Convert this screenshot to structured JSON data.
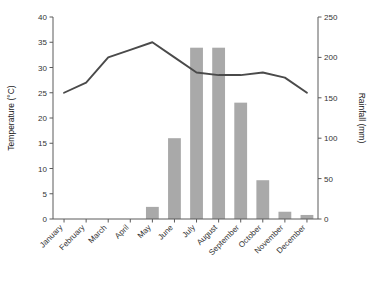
{
  "chart_data": {
    "type": "bar",
    "title": "",
    "subtitle": "",
    "categories": [
      "January",
      "February",
      "March",
      "April",
      "May",
      "June",
      "July",
      "August",
      "September",
      "October",
      "November",
      "December"
    ],
    "series": [
      {
        "name": "Rainfall",
        "type": "bar",
        "axis": "right",
        "unit": "mm",
        "values": [
          0,
          0,
          0,
          0,
          15,
          100,
          212,
          212,
          144,
          48,
          9,
          5
        ]
      },
      {
        "name": "Temperature",
        "type": "line",
        "axis": "left",
        "unit": "°C",
        "values": [
          25,
          27,
          32,
          33.5,
          35,
          32,
          29,
          28.5,
          28.5,
          29,
          28,
          25
        ]
      }
    ],
    "xlabel": "",
    "ylabel": "Temperature (°C)",
    "y2label": "Rainfall (mm)",
    "ylim": [
      0,
      40
    ],
    "y2lim": [
      0,
      250
    ],
    "yticks": [
      "0",
      "5",
      "10",
      "15",
      "20",
      "25",
      "30",
      "35",
      "40"
    ],
    "y2ticks": [
      "0",
      "50",
      "100",
      "150",
      "200",
      "250"
    ],
    "grid": false,
    "legend": "none",
    "colors": {
      "bar": "#a9a9a9",
      "line": "#4a4a4a",
      "axis": "#5a5a5a",
      "text": "#333333",
      "background": "#ffffff"
    }
  }
}
